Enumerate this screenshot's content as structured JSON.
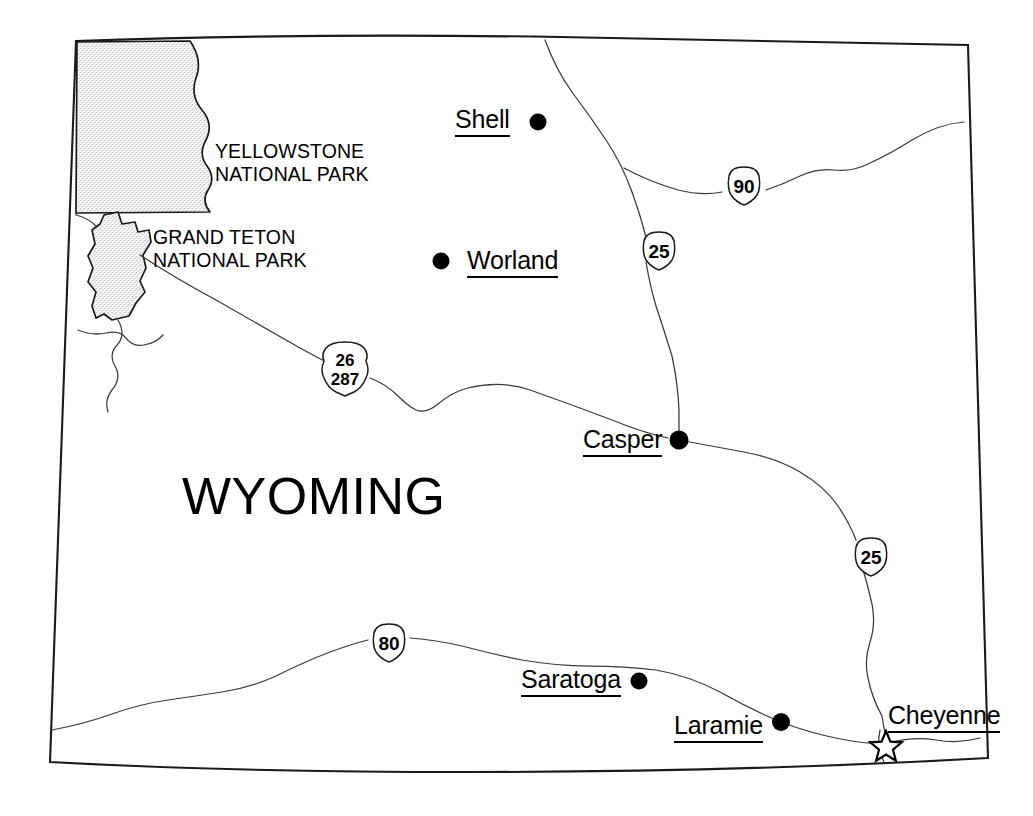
{
  "map": {
    "title": "WYOMING",
    "state_label": "WYOMING",
    "background_color": "#ffffff",
    "line_color": "#1a1a1a",
    "stipple_color": "#d9d9d9",
    "parks": [
      {
        "id": "yellowstone",
        "name_line1": "YELLOWSTONE",
        "name_line2": "NATIONAL PARK",
        "label_x": 215,
        "label_y": 146
      },
      {
        "id": "grand-teton",
        "name_line1": "GRAND TETON",
        "name_line2": "NATIONAL PARK",
        "label_x": 153,
        "label_y": 232
      }
    ],
    "cities": [
      {
        "id": "shell",
        "name": "Shell",
        "label_x": 455,
        "label_y": 106,
        "dot_x": 538,
        "dot_y": 122,
        "dot_r": 8.5,
        "marker": "dot",
        "dot_side": "right"
      },
      {
        "id": "worland",
        "name": "Worland",
        "label_x": 467,
        "label_y": 248,
        "dot_x": 441,
        "dot_y": 261,
        "dot_r": 8.5,
        "marker": "dot",
        "dot_side": "left"
      },
      {
        "id": "casper",
        "name": "Casper",
        "label_x": 583,
        "label_y": 427,
        "dot_x": 679,
        "dot_y": 440,
        "dot_r": 9.5,
        "marker": "dot",
        "dot_side": "right"
      },
      {
        "id": "saratoga",
        "name": "Saratoga",
        "label_x": 521,
        "label_y": 667,
        "dot_x": 639,
        "dot_y": 681,
        "dot_r": 8.5,
        "marker": "dot",
        "dot_side": "right"
      },
      {
        "id": "laramie",
        "name": "Laramie",
        "label_x": 674,
        "label_y": 713,
        "dot_x": 781,
        "dot_y": 722,
        "dot_r": 9,
        "marker": "dot",
        "dot_side": "right"
      },
      {
        "id": "cheyenne",
        "name": "Cheyenne",
        "label_x": 888,
        "label_y": 703,
        "dot_x": 886,
        "dot_y": 744,
        "dot_r": 11,
        "marker": "star",
        "dot_side": "below-left"
      }
    ],
    "highways": [
      {
        "id": "i-90",
        "type": "interstate",
        "number": "90",
        "x": 744,
        "y": 183
      },
      {
        "id": "i-25-north",
        "type": "interstate",
        "number": "25",
        "x": 659,
        "y": 248
      },
      {
        "id": "i-25-south",
        "type": "interstate",
        "number": "25",
        "x": 871,
        "y": 554
      },
      {
        "id": "i-80",
        "type": "interstate",
        "number": "80",
        "x": 389,
        "y": 640
      },
      {
        "id": "us-26-287",
        "type": "us-route",
        "number": "26",
        "number2": "287",
        "x": 345,
        "y": 366
      }
    ]
  }
}
